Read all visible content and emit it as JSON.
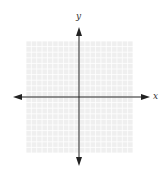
{
  "diagram": {
    "type": "coordinate-plane",
    "x_axis_label": "x",
    "y_axis_label": "y",
    "grid": {
      "columns": 20,
      "rows": 20,
      "left": 26,
      "top": 41,
      "width": 107,
      "height": 112,
      "line_color": "#e4e4e4",
      "background_color": "#efefef"
    },
    "origin": {
      "x": 79,
      "y": 97
    },
    "axis_color": "#222222",
    "arrows": {
      "x_left_tip": 13,
      "x_right_tip": 150,
      "y_top_tip": 27,
      "y_bottom_tip": 166
    }
  }
}
